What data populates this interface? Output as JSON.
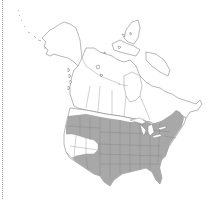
{
  "map": {
    "type": "species range map",
    "region": "North America",
    "colors": {
      "background": "#ffffff",
      "land": "#ffffff",
      "outline": "#6e6e6e",
      "range_fill": "#a8a8a8",
      "frame_border": "#9a9a9a"
    },
    "legend": {
      "range_label": "Range"
    },
    "range": {
      "description": "Shaded across most of the contiguous United States and southernmost Canada, excluding the Great Basin / interior West and California coast interior",
      "includes": [
        "Eastern United States",
        "Great Plains",
        "Midwest",
        "Pacific Northwest",
        "Southwest",
        "Texas",
        "Florida",
        "New England",
        "Southern Ontario/Quebec"
      ],
      "excludes": [
        "Alaska",
        "Northern Canada",
        "Great Basin",
        "California"
      ]
    }
  }
}
